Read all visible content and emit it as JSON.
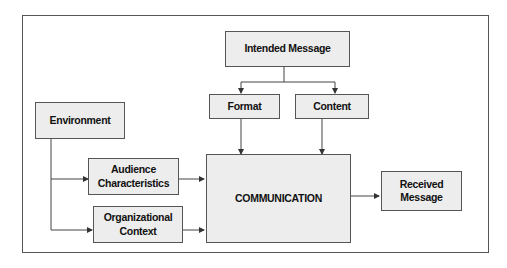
{
  "diagram": {
    "nodes": {
      "intended_message": "Intended Message",
      "format": "Format",
      "content": "Content",
      "environment": "Environment",
      "audience": {
        "line1": "Audience",
        "line2": "Characteristics"
      },
      "organizational": {
        "line1": "Organizational",
        "line2": "Context"
      },
      "communication": "COMMUNICATION",
      "received": {
        "line1": "Received",
        "line2": "Message"
      }
    },
    "edges": [
      {
        "from": "Intended Message",
        "to": "Format"
      },
      {
        "from": "Intended Message",
        "to": "Content"
      },
      {
        "from": "Format",
        "to": "COMMUNICATION"
      },
      {
        "from": "Content",
        "to": "COMMUNICATION"
      },
      {
        "from": "Environment",
        "to": "Audience Characteristics"
      },
      {
        "from": "Environment",
        "to": "Organizational Context"
      },
      {
        "from": "Audience Characteristics",
        "to": "COMMUNICATION"
      },
      {
        "from": "Organizational Context",
        "to": "COMMUNICATION"
      },
      {
        "from": "COMMUNICATION",
        "to": "Received Message"
      }
    ],
    "colors": {
      "box_fill": "#ededed",
      "stroke": "#555555",
      "text": "#111111"
    }
  }
}
